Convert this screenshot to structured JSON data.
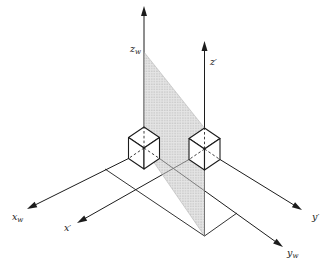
{
  "figure": {
    "canvas": {
      "width": 336,
      "height": 265,
      "background": "#ffffff"
    },
    "colors": {
      "line": "#1c1c1c",
      "cube_fill": "#ffffff",
      "shade_base": "rgba(208,208,208,0.55)",
      "shade_dot": "rgba(110,110,110,0.60)"
    },
    "shaded_plane": {
      "name": "shaded-plane",
      "points": [
        [
          144,
          52
        ],
        [
          204.5,
          128
        ],
        [
          204.5,
          236
        ],
        [
          144,
          148
        ]
      ]
    },
    "axes": [
      {
        "id": "zw",
        "from": [
          144,
          127
        ],
        "tip": [
          144,
          6
        ],
        "label": {
          "main": "z",
          "suffix": "w",
          "suffix_type": "sub",
          "x": 130,
          "y": 52,
          "anchor": "start"
        }
      },
      {
        "id": "zp",
        "from": [
          204.5,
          128
        ],
        "tip": [
          204.5,
          41
        ],
        "label": {
          "main": "z",
          "suffix": "′",
          "suffix_type": "prime",
          "x": 210,
          "y": 65,
          "anchor": "start"
        }
      },
      {
        "id": "xw",
        "from": [
          128.5,
          158.5
        ],
        "tip": [
          27,
          209
        ],
        "label": {
          "main": "x",
          "suffix": "w",
          "suffix_type": "sub",
          "x": 12,
          "y": 220,
          "anchor": "start"
        }
      },
      {
        "id": "xp",
        "from": [
          189,
          159.5
        ],
        "tip": [
          77,
          223
        ],
        "label": {
          "main": "x",
          "suffix": "′",
          "suffix_type": "prime",
          "x": 64,
          "y": 231,
          "anchor": "start"
        }
      },
      {
        "id": "yw",
        "from": [
          159.5,
          158.5
        ],
        "tip": [
          283,
          247
        ],
        "label": {
          "main": "y",
          "suffix": "w",
          "suffix_type": "sub",
          "x": 287,
          "y": 256,
          "anchor": "start"
        }
      },
      {
        "id": "yp",
        "from": [
          220,
          159.5
        ],
        "tip": [
          302,
          210
        ],
        "label": {
          "main": "y",
          "suffix": "′",
          "suffix_type": "prime",
          "x": 312,
          "y": 220,
          "anchor": "start"
        }
      }
    ],
    "cubes": [
      {
        "id": "cube-left",
        "top": [
          144,
          127
        ],
        "half_width": 15.5,
        "diag_drop": 10.5,
        "height": 21
      },
      {
        "id": "cube-right",
        "top": [
          204.5,
          128
        ],
        "half_width": 15.5,
        "diag_drop": 10.5,
        "height": 21
      }
    ],
    "hidden_edges": [
      {
        "cube": "cube-left",
        "segments": [
          [
            [
              144,
              148
            ],
            [
              128.5,
              158.5
            ]
          ],
          [
            [
              144,
              148
            ],
            [
              159.5,
              158.5
            ]
          ],
          [
            [
              144,
              148
            ],
            [
              144,
              127
            ]
          ]
        ]
      },
      {
        "cube": "cube-right",
        "segments": [
          [
            [
              204.5,
              149
            ],
            [
              189,
              159.5
            ]
          ],
          [
            [
              204.5,
              149
            ],
            [
              220,
              159.5
            ]
          ],
          [
            [
              204.5,
              149
            ],
            [
              204.5,
              128
            ]
          ],
          [
            [
              204.5,
              149
            ],
            [
              204.5,
              170
            ]
          ]
        ]
      }
    ],
    "construction_segments": [
      {
        "name": "segment-y-offset-to-ground-point",
        "from": [
          237,
          213
        ],
        "to": [
          204.5,
          236
        ]
      },
      {
        "name": "segment-x-offset-to-ground-point",
        "from": [
          105,
          169
        ],
        "to": [
          204.5,
          236
        ]
      },
      {
        "name": "segment-vertical-riser",
        "from": [
          204.5,
          236
        ],
        "to": [
          204.5,
          170
        ]
      }
    ],
    "arrowhead": {
      "length": 10,
      "half_width": 3
    }
  }
}
